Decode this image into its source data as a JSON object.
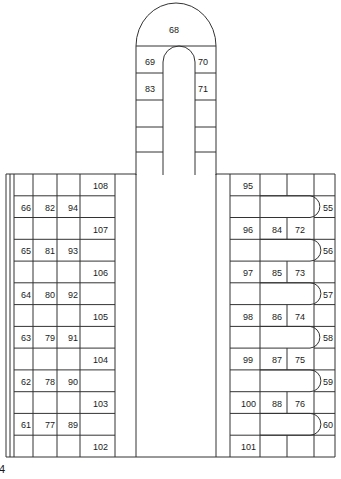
{
  "figure": {
    "background": "#ffffff",
    "line_color": "#333333",
    "text_color": "#1a1a1a",
    "corner_label": "4"
  },
  "tower": {
    "name": "domed-tower",
    "cells": [
      {
        "id": "tower-68",
        "label": "68",
        "x": 169,
        "y": 26
      },
      {
        "id": "tower-69",
        "label": "69",
        "x": 145,
        "y": 58
      },
      {
        "id": "tower-70",
        "label": "70",
        "x": 198,
        "y": 58
      },
      {
        "id": "tower-83",
        "label": "83",
        "x": 145,
        "y": 85
      },
      {
        "id": "tower-71",
        "label": "71",
        "x": 198,
        "y": 85
      }
    ]
  },
  "left_grid": {
    "name": "left-conductor-grid",
    "columns": [
      {
        "id": "col-a",
        "labels": [
          "66",
          "65",
          "64",
          "63",
          "62",
          "61"
        ]
      },
      {
        "id": "col-b",
        "labels": [
          "82",
          "81",
          "80",
          "79",
          "78",
          "77"
        ]
      },
      {
        "id": "col-c",
        "labels": [
          "94",
          "93",
          "92",
          "91",
          "90",
          "89"
        ]
      },
      {
        "id": "col-d",
        "labels": [
          "108",
          "107",
          "106",
          "105",
          "104",
          "103",
          "102"
        ]
      }
    ],
    "cells": [
      {
        "id": "left-108",
        "label": "108",
        "x": 93,
        "y": 182
      },
      {
        "id": "left-66",
        "label": "66",
        "x": 21,
        "y": 204
      },
      {
        "id": "left-82",
        "label": "82",
        "x": 45,
        "y": 204
      },
      {
        "id": "left-94",
        "label": "94",
        "x": 68,
        "y": 204
      },
      {
        "id": "left-107",
        "label": "107",
        "x": 93,
        "y": 226
      },
      {
        "id": "left-65",
        "label": "65",
        "x": 21,
        "y": 247
      },
      {
        "id": "left-81",
        "label": "81",
        "x": 45,
        "y": 247
      },
      {
        "id": "left-93",
        "label": "93",
        "x": 68,
        "y": 247
      },
      {
        "id": "left-106",
        "label": "106",
        "x": 93,
        "y": 269
      },
      {
        "id": "left-64",
        "label": "64",
        "x": 21,
        "y": 291
      },
      {
        "id": "left-80",
        "label": "80",
        "x": 45,
        "y": 291
      },
      {
        "id": "left-92",
        "label": "92",
        "x": 68,
        "y": 291
      },
      {
        "id": "left-105",
        "label": "105",
        "x": 93,
        "y": 313
      },
      {
        "id": "left-63",
        "label": "63",
        "x": 21,
        "y": 334
      },
      {
        "id": "left-79",
        "label": "79",
        "x": 45,
        "y": 334
      },
      {
        "id": "left-91",
        "label": "91",
        "x": 68,
        "y": 334
      },
      {
        "id": "left-104",
        "label": "104",
        "x": 93,
        "y": 356
      },
      {
        "id": "left-62",
        "label": "62",
        "x": 21,
        "y": 378
      },
      {
        "id": "left-78",
        "label": "78",
        "x": 45,
        "y": 378
      },
      {
        "id": "left-90",
        "label": "90",
        "x": 68,
        "y": 378
      },
      {
        "id": "left-103",
        "label": "103",
        "x": 93,
        "y": 400
      },
      {
        "id": "left-61",
        "label": "61",
        "x": 21,
        "y": 421
      },
      {
        "id": "left-77",
        "label": "77",
        "x": 45,
        "y": 421
      },
      {
        "id": "left-89",
        "label": "89",
        "x": 68,
        "y": 421
      },
      {
        "id": "left-102",
        "label": "102",
        "x": 93,
        "y": 443
      }
    ]
  },
  "right_grid": {
    "name": "right-hairpin-winding",
    "columns": [
      {
        "id": "col-e",
        "labels": [
          "95",
          "96",
          "97",
          "98",
          "99",
          "100",
          "101"
        ]
      },
      {
        "id": "col-f",
        "labels": [
          "84",
          "85",
          "86",
          "87",
          "88"
        ]
      },
      {
        "id": "col-g",
        "labels": [
          "72",
          "73",
          "74",
          "75",
          "76"
        ]
      },
      {
        "id": "col-h",
        "labels": [
          "55",
          "56",
          "57",
          "58",
          "59",
          "60"
        ]
      }
    ],
    "cells": [
      {
        "id": "right-95",
        "label": "95",
        "x": 243,
        "y": 182
      },
      {
        "id": "right-55",
        "label": "55",
        "x": 323,
        "y": 204
      },
      {
        "id": "right-96",
        "label": "96",
        "x": 243,
        "y": 226
      },
      {
        "id": "right-84",
        "label": "84",
        "x": 272,
        "y": 226
      },
      {
        "id": "right-72",
        "label": "72",
        "x": 295,
        "y": 226
      },
      {
        "id": "right-56",
        "label": "56",
        "x": 323,
        "y": 247
      },
      {
        "id": "right-97",
        "label": "97",
        "x": 243,
        "y": 269
      },
      {
        "id": "right-85",
        "label": "85",
        "x": 272,
        "y": 269
      },
      {
        "id": "right-73",
        "label": "73",
        "x": 295,
        "y": 269
      },
      {
        "id": "right-57",
        "label": "57",
        "x": 323,
        "y": 291
      },
      {
        "id": "right-98",
        "label": "98",
        "x": 243,
        "y": 313
      },
      {
        "id": "right-86",
        "label": "86",
        "x": 272,
        "y": 313
      },
      {
        "id": "right-74",
        "label": "74",
        "x": 295,
        "y": 313
      },
      {
        "id": "right-58",
        "label": "58",
        "x": 323,
        "y": 334
      },
      {
        "id": "right-99",
        "label": "99",
        "x": 243,
        "y": 356
      },
      {
        "id": "right-87",
        "label": "87",
        "x": 272,
        "y": 356
      },
      {
        "id": "right-75",
        "label": "75",
        "x": 295,
        "y": 356
      },
      {
        "id": "right-59",
        "label": "59",
        "x": 323,
        "y": 378
      },
      {
        "id": "right-100",
        "label": "100",
        "x": 241,
        "y": 400
      },
      {
        "id": "right-88",
        "label": "88",
        "x": 272,
        "y": 400
      },
      {
        "id": "right-76",
        "label": "76",
        "x": 295,
        "y": 400
      },
      {
        "id": "right-60",
        "label": "60",
        "x": 323,
        "y": 421
      },
      {
        "id": "right-101",
        "label": "101",
        "x": 241,
        "y": 443
      }
    ]
  }
}
